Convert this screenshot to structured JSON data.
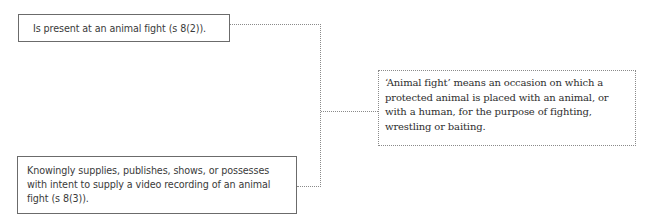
{
  "diagram": {
    "offences": [
      {
        "id": "present",
        "text": "Is present at an animal fight (s 8(2))."
      },
      {
        "id": "video",
        "text": "Knowingly supplies, publishes, shows, or possesses with intent to supply a video recording of an animal fight (s 8(3))."
      }
    ],
    "definition": {
      "text": "‘Animal fight’ means an occasion on which a protected animal is placed with an animal, or with a human, for the purpose of fighting, wrestling or baiting."
    },
    "colors": {
      "solid_border": "#6b6b6b",
      "dotted_border": "#8a8a8a",
      "text": "#3a3a3a",
      "background": "#ffffff"
    }
  }
}
